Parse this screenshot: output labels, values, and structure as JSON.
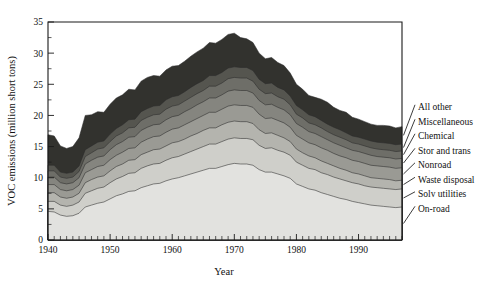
{
  "chart_data": {
    "type": "area",
    "stacked": true,
    "title": "",
    "xlabel": "Year",
    "ylabel": "VOC emissions (million short tons)",
    "xlim": [
      1940,
      1997
    ],
    "ylim": [
      0,
      35
    ],
    "ytick_step": 5,
    "yminor_step": 2.5,
    "xtick_labels": [
      "1940",
      "1950",
      "1960",
      "1970",
      "1980",
      "1990"
    ],
    "xtick_values": [
      1940,
      1950,
      1960,
      1970,
      1980,
      1990
    ],
    "ytick_labels": [
      "0",
      "5",
      "10",
      "15",
      "20",
      "25",
      "30",
      "35"
    ],
    "ytick_values": [
      0,
      5,
      10,
      15,
      20,
      25,
      30,
      35
    ],
    "grid": false,
    "legend_position": "right-outside",
    "x": [
      1940,
      1941,
      1942,
      1943,
      1944,
      1945,
      1946,
      1947,
      1948,
      1949,
      1950,
      1951,
      1952,
      1953,
      1954,
      1955,
      1956,
      1957,
      1958,
      1959,
      1960,
      1961,
      1962,
      1963,
      1964,
      1965,
      1966,
      1967,
      1968,
      1969,
      1970,
      1971,
      1972,
      1973,
      1974,
      1975,
      1976,
      1977,
      1978,
      1979,
      1980,
      1981,
      1982,
      1983,
      1984,
      1985,
      1986,
      1987,
      1988,
      1989,
      1990,
      1991,
      1992,
      1993,
      1994,
      1995,
      1996,
      1997
    ],
    "series": [
      {
        "name": "On-road",
        "color": "#e2e2df",
        "values": [
          4.6,
          4.5,
          4.0,
          3.8,
          3.9,
          4.3,
          5.3,
          5.6,
          5.9,
          6.1,
          6.6,
          7.1,
          7.4,
          7.8,
          7.9,
          8.4,
          8.7,
          9.0,
          9.1,
          9.5,
          9.8,
          10.0,
          10.3,
          10.6,
          10.9,
          11.2,
          11.5,
          11.5,
          11.8,
          12.1,
          12.3,
          12.2,
          12.2,
          12.0,
          11.3,
          10.9,
          10.9,
          10.6,
          10.3,
          9.9,
          9.0,
          8.6,
          8.2,
          8.0,
          7.6,
          7.3,
          7.0,
          6.7,
          6.5,
          6.2,
          6.0,
          5.8,
          5.6,
          5.5,
          5.4,
          5.3,
          5.2,
          5.3
        ]
      },
      {
        "name": "Solv utilities",
        "color": "#cfcfca",
        "values": [
          1.6,
          1.7,
          1.6,
          1.6,
          1.7,
          1.8,
          2.2,
          2.3,
          2.4,
          2.4,
          2.6,
          2.7,
          2.8,
          2.9,
          2.9,
          3.1,
          3.2,
          3.2,
          3.2,
          3.3,
          3.4,
          3.4,
          3.5,
          3.6,
          3.7,
          3.8,
          3.9,
          3.9,
          4.0,
          4.1,
          4.1,
          4.1,
          4.1,
          4.1,
          3.9,
          3.8,
          3.9,
          3.8,
          3.8,
          3.7,
          3.5,
          3.4,
          3.3,
          3.3,
          3.2,
          3.2,
          3.1,
          3.1,
          3.0,
          3.0,
          3.0,
          2.9,
          2.9,
          2.9,
          2.9,
          2.9,
          2.9,
          2.9
        ]
      },
      {
        "name": "Waste disposal",
        "color": "#b4b4ae",
        "values": [
          1.4,
          1.4,
          1.3,
          1.3,
          1.3,
          1.4,
          1.7,
          1.8,
          1.8,
          1.8,
          1.9,
          2.0,
          2.0,
          2.1,
          2.1,
          2.2,
          2.2,
          2.3,
          2.3,
          2.3,
          2.4,
          2.4,
          2.4,
          2.5,
          2.5,
          2.6,
          2.6,
          2.6,
          2.7,
          2.7,
          2.7,
          2.7,
          2.7,
          2.6,
          2.5,
          2.4,
          2.4,
          2.4,
          2.3,
          2.2,
          2.1,
          2.0,
          2.0,
          1.9,
          1.9,
          1.8,
          1.8,
          1.7,
          1.7,
          1.6,
          1.6,
          1.6,
          1.5,
          1.5,
          1.5,
          1.5,
          1.4,
          1.4
        ]
      },
      {
        "name": "Nonroad",
        "color": "#9a9a94",
        "values": [
          1.3,
          1.3,
          1.2,
          1.2,
          1.2,
          1.3,
          1.6,
          1.6,
          1.7,
          1.7,
          1.8,
          1.8,
          1.9,
          1.9,
          1.9,
          2.0,
          2.1,
          2.1,
          2.1,
          2.2,
          2.2,
          2.2,
          2.3,
          2.3,
          2.4,
          2.4,
          2.5,
          2.5,
          2.5,
          2.6,
          2.6,
          2.6,
          2.6,
          2.6,
          2.5,
          2.4,
          2.4,
          2.4,
          2.4,
          2.3,
          2.2,
          2.2,
          2.1,
          2.1,
          2.1,
          2.1,
          2.0,
          2.0,
          2.0,
          2.0,
          2.0,
          2.0,
          2.0,
          2.0,
          2.0,
          2.0,
          2.0,
          2.0
        ]
      },
      {
        "name": "Stor and trans",
        "color": "#85857f",
        "values": [
          1.2,
          1.2,
          1.1,
          1.1,
          1.1,
          1.2,
          1.4,
          1.5,
          1.5,
          1.5,
          1.6,
          1.7,
          1.7,
          1.8,
          1.8,
          1.9,
          1.9,
          1.9,
          1.9,
          2.0,
          2.0,
          2.0,
          2.1,
          2.1,
          2.2,
          2.2,
          2.3,
          2.3,
          2.3,
          2.4,
          2.4,
          2.4,
          2.4,
          2.3,
          2.2,
          2.2,
          2.2,
          2.1,
          2.1,
          2.0,
          1.9,
          1.9,
          1.8,
          1.8,
          1.8,
          1.7,
          1.7,
          1.7,
          1.6,
          1.6,
          1.6,
          1.6,
          1.6,
          1.5,
          1.5,
          1.5,
          1.5,
          1.5
        ]
      },
      {
        "name": "Chemical",
        "color": "#6e6e68",
        "values": [
          1.0,
          1.0,
          0.9,
          0.9,
          0.9,
          1.0,
          1.2,
          1.2,
          1.3,
          1.3,
          1.3,
          1.4,
          1.4,
          1.5,
          1.5,
          1.6,
          1.6,
          1.6,
          1.6,
          1.7,
          1.7,
          1.7,
          1.7,
          1.8,
          1.8,
          1.8,
          1.9,
          1.9,
          1.9,
          2.0,
          2.0,
          2.0,
          2.0,
          1.9,
          1.8,
          1.8,
          1.8,
          1.7,
          1.7,
          1.6,
          1.5,
          1.5,
          1.4,
          1.4,
          1.4,
          1.3,
          1.3,
          1.3,
          1.3,
          1.2,
          1.2,
          1.2,
          1.2,
          1.2,
          1.2,
          1.2,
          1.2,
          1.2
        ]
      },
      {
        "name": "Miscellaneous",
        "color": "#55554f",
        "values": [
          0.9,
          0.9,
          0.8,
          0.8,
          0.8,
          0.9,
          1.1,
          1.1,
          1.1,
          1.1,
          1.2,
          1.2,
          1.3,
          1.3,
          1.3,
          1.4,
          1.4,
          1.4,
          1.4,
          1.5,
          1.5,
          1.5,
          1.5,
          1.6,
          1.6,
          1.6,
          1.7,
          1.7,
          1.7,
          1.7,
          1.7,
          1.7,
          1.7,
          1.7,
          1.6,
          1.6,
          1.6,
          1.5,
          1.5,
          1.4,
          1.4,
          1.3,
          1.3,
          1.3,
          1.2,
          1.2,
          1.2,
          1.2,
          1.1,
          1.1,
          1.1,
          1.1,
          1.1,
          1.1,
          1.1,
          1.1,
          1.1,
          1.1
        ]
      },
      {
        "name": "All other",
        "color": "#32322e",
        "values": [
          4.9,
          4.7,
          4.2,
          4.0,
          4.1,
          4.5,
          5.5,
          5.0,
          4.9,
          4.6,
          4.8,
          4.9,
          4.8,
          4.9,
          4.7,
          4.9,
          5.0,
          4.9,
          4.7,
          4.8,
          4.9,
          4.8,
          4.9,
          5.0,
          5.1,
          5.2,
          5.3,
          5.2,
          5.3,
          5.4,
          5.4,
          4.8,
          4.6,
          4.5,
          4.2,
          4.0,
          4.1,
          4.0,
          3.9,
          3.7,
          3.4,
          3.3,
          3.1,
          3.1,
          3.4,
          3.5,
          3.2,
          3.1,
          3.3,
          3.0,
          2.9,
          2.8,
          2.7,
          2.7,
          2.8,
          2.8,
          2.7,
          2.8
        ]
      }
    ],
    "totals": [
      16.9,
      16.7,
      15.1,
      14.7,
      15.0,
      16.4,
      20.0,
      20.1,
      20.6,
      20.5,
      21.8,
      22.8,
      23.3,
      24.2,
      24.1,
      25.5,
      26.1,
      26.4,
      26.3,
      27.3,
      27.9,
      28.0,
      28.7,
      29.5,
      30.2,
      30.8,
      31.7,
      31.6,
      32.2,
      33.0,
      33.2,
      32.5,
      32.3,
      31.7,
      30.0,
      29.1,
      29.3,
      28.5,
      28.0,
      26.8,
      25.0,
      24.2,
      23.2,
      22.9,
      22.6,
      22.1,
      21.3,
      20.8,
      20.5,
      19.7,
      19.4,
      19.0,
      18.6,
      18.4,
      18.4,
      18.3,
      18.0,
      18.2
    ],
    "legend_entries": [
      {
        "label": "All other",
        "color": "#32322e"
      },
      {
        "label": "Miscellaneous",
        "color": "#55554f"
      },
      {
        "label": "Chemical",
        "color": "#6e6e68"
      },
      {
        "label": "Stor and trans",
        "color": "#85857f"
      },
      {
        "label": "Nonroad",
        "color": "#9a9a94"
      },
      {
        "label": "Waste disposal",
        "color": "#b4b4ae"
      },
      {
        "label": "Solv utilities",
        "color": "#cfcfca"
      },
      {
        "label": "On-road",
        "color": "#e2e2df"
      }
    ]
  },
  "axes": {
    "ylabel": "VOC emissions (million short tons)",
    "xlabel": "Year"
  }
}
